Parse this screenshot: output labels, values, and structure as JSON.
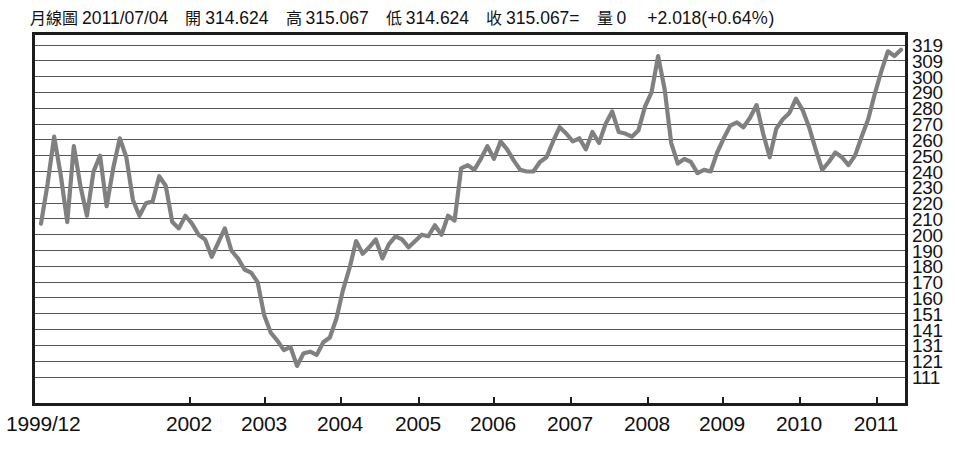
{
  "header": {
    "chart_type_label": "月線圖",
    "date": "2011/07/04",
    "open_label": "開",
    "open_value": "314.624",
    "high_label": "高",
    "high_value": "315.067",
    "low_label": "低",
    "low_value": "314.624",
    "close_label": "收",
    "close_value": "315.067=",
    "volume_label": "量",
    "volume_value": "0",
    "change": "+2.018(+0.64％)"
  },
  "style": {
    "line_color": "#808080",
    "grid_color": "#565656",
    "border_color": "#1c1c1c",
    "text_color": "#111111",
    "background": "#ffffff"
  },
  "chart_data": {
    "type": "line",
    "title": "月線圖 2011/07/04",
    "xlabel": "",
    "ylabel": "",
    "grid": true,
    "legend": false,
    "ylim": [
      111,
      319
    ],
    "yticks": [
      319,
      309,
      300,
      290,
      280,
      270,
      260,
      250,
      240,
      230,
      220,
      210,
      200,
      190,
      180,
      170,
      160,
      151,
      141,
      131,
      121,
      111
    ],
    "xticks": [
      "1999/12",
      "2002",
      "2003",
      "2004",
      "2005",
      "2006",
      "2007",
      "2008",
      "2009",
      "2010",
      "2011"
    ],
    "xtick_positions_px": [
      34,
      189,
      264,
      340,
      418,
      493,
      570,
      647,
      722,
      799,
      876
    ],
    "x_start_label": "1999/12",
    "series": [
      {
        "name": "月線",
        "values": [
          207,
          232,
          262,
          238,
          208,
          256,
          231,
          212,
          240,
          250,
          218,
          242,
          261,
          249,
          222,
          212,
          220,
          221,
          237,
          231,
          208,
          204,
          212,
          207,
          200,
          197,
          186,
          195,
          204,
          190,
          185,
          178,
          176,
          170,
          150,
          139,
          134,
          128,
          130,
          118,
          126,
          127,
          125,
          133,
          136,
          148,
          165,
          179,
          196,
          188,
          192,
          197,
          185,
          194,
          199,
          197,
          192,
          196,
          200,
          199,
          206,
          200,
          212,
          209,
          242,
          244,
          241,
          248,
          256,
          248,
          259,
          254,
          247,
          241,
          240,
          240,
          246,
          249,
          259,
          268,
          264,
          259,
          261,
          254,
          265,
          258,
          270,
          278,
          265,
          264,
          262,
          266,
          281,
          290,
          312,
          292,
          258,
          245,
          248,
          246,
          239,
          241,
          240,
          252,
          261,
          269,
          271,
          268,
          274,
          282,
          264,
          249,
          267,
          273,
          277,
          286,
          279,
          268,
          254,
          241,
          246,
          252,
          249,
          244,
          250,
          262,
          273,
          289,
          303,
          315,
          312,
          316
        ]
      }
    ]
  }
}
